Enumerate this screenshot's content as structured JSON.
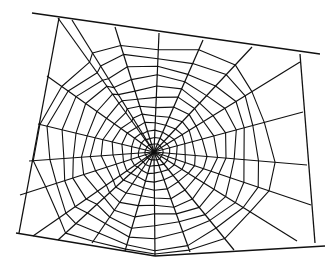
{
  "image": {
    "subject": "spider web line drawing",
    "background_color": "#ffffff",
    "stroke_color": "#111111",
    "width": 336,
    "height": 266
  },
  "web": {
    "center": [
      154,
      152
    ],
    "frame": [
      [
        32,
        13
      ],
      [
        320,
        54
      ],
      [
        327,
        246
      ],
      [
        155,
        256
      ],
      [
        16,
        233
      ]
    ],
    "anchor_lines": [
      [
        [
          32,
          13
        ],
        [
          320,
          54
        ]
      ],
      [
        [
          300,
          54
        ],
        [
          315,
          243
        ]
      ],
      [
        [
          325,
          246
        ],
        [
          155,
          256
        ]
      ],
      [
        [
          155,
          256
        ],
        [
          16,
          233
        ]
      ],
      [
        [
          59,
          18
        ],
        [
          19,
          233
        ]
      ]
    ],
    "spoke_endpoints": [
      [
        159,
        33
      ],
      [
        203,
        40
      ],
      [
        252,
        47
      ],
      [
        300,
        62
      ],
      [
        303,
        112
      ],
      [
        307,
        165
      ],
      [
        311,
        205
      ],
      [
        297,
        241
      ],
      [
        234,
        250
      ],
      [
        190,
        252
      ],
      [
        155,
        256
      ],
      [
        125,
        251
      ],
      [
        92,
        243
      ],
      [
        58,
        240
      ],
      [
        33,
        236
      ],
      [
        20,
        195
      ],
      [
        29,
        161
      ],
      [
        38,
        124
      ],
      [
        47,
        76
      ],
      [
        58,
        18
      ],
      [
        72,
        20
      ],
      [
        115,
        27
      ]
    ],
    "ring_count": 12,
    "ring_radii": [
      8,
      14,
      21,
      29,
      37,
      46,
      55,
      64,
      74,
      84,
      95,
      106
    ]
  }
}
